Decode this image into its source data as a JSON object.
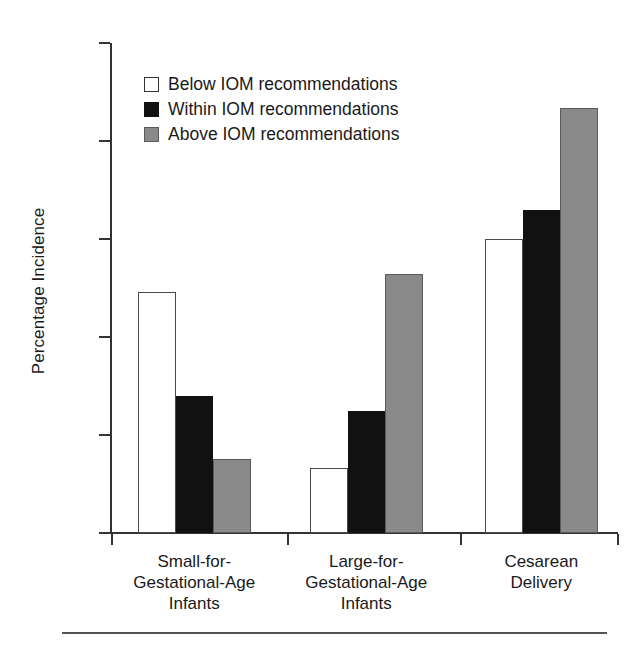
{
  "chart_data": {
    "type": "bar",
    "title": "",
    "subtitle": "",
    "xlabel": "",
    "ylabel": "Percentage Incidence",
    "ylim": [
      0,
      25
    ],
    "yticks": [
      0,
      5,
      10,
      15,
      20,
      25
    ],
    "ytick_labels": [
      "0",
      "5",
      "10",
      "15",
      "20",
      "25"
    ],
    "grid": false,
    "legend_position": "upper-left-inside",
    "categories": [
      "Small-for-\nGestational-Age\nInfants",
      "Large-for-\nGestational-Age\nInfants",
      "Cesarean\nDelivery"
    ],
    "series": [
      {
        "name": "Below IOM recommendations",
        "color": "#ffffff",
        "edge_color": "#4a4a4a",
        "values": [
          12.3,
          3.3,
          15.0
        ]
      },
      {
        "name": "Within IOM recommendations",
        "color": "#111111",
        "edge_color": "#111111",
        "values": [
          7.0,
          6.2,
          16.5
        ]
      },
      {
        "name": "Above IOM recommendations",
        "color": "#8a8a8a",
        "edge_color": "#5a5a5a",
        "values": [
          3.8,
          13.2,
          21.7
        ]
      }
    ]
  },
  "axis": {
    "y_label": "Percentage Incidence",
    "y_tick_labels": [
      "25",
      "20",
      "15",
      "10",
      "5",
      "0"
    ]
  },
  "legend": {
    "items": [
      {
        "label": "Below IOM recommendations",
        "swatch": "white-square"
      },
      {
        "label": "Within IOM recommendations",
        "swatch": "black-square"
      },
      {
        "label": "Above IOM recommendations",
        "swatch": "gray-square"
      }
    ]
  },
  "groups": [
    {
      "caption": "Small-for-\nGestational-Age\nInfants"
    },
    {
      "caption": "Large-for-\nGestational-Age\nInfants"
    },
    {
      "caption": "Cesarean\nDelivery"
    }
  ]
}
